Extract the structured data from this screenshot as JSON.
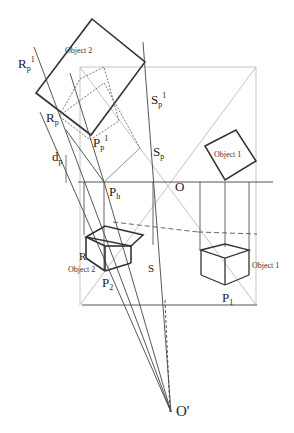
{
  "diagram": {
    "labels": {
      "object2_top": "Object 2",
      "object1_top": "Object 1",
      "object2_bottom": "Object 2",
      "object1_bottom": "Object 1",
      "Rp1_base": "R",
      "Rp1_sub": "p",
      "Rp1_sup": "1",
      "Rp_base": "R",
      "Rp_sub": "p",
      "Pp1_base": "P",
      "Pp1_sub": "p",
      "Pp1_sup": "1",
      "Sp1_base": "S",
      "Sp1_sub": "p",
      "Sp1_sup": "1",
      "Sp_base": "S",
      "Sp_sub": "p",
      "dp_base": "d",
      "dp_sub": "p",
      "Ph_base": "P",
      "Ph_sub": "h",
      "O": "O",
      "R": "R",
      "S": "S",
      "P2_base": "P",
      "P2_sub": "2",
      "P1_base": "P",
      "P1_sub": "1",
      "Oprime": "O'"
    },
    "colors": {
      "dark_line": "#333333",
      "thin_line": "#555555",
      "light_line": "#bbbbbb",
      "background": "#ffffff"
    }
  }
}
